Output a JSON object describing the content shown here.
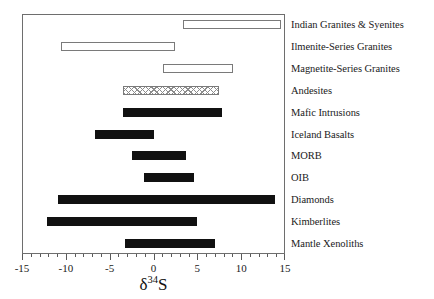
{
  "chart_data": {
    "type": "bar",
    "orientation": "horizontal-range",
    "title": "",
    "xlabel": "δ³⁴S",
    "ylabel": "",
    "xlim": [
      -15,
      15
    ],
    "xticks": [
      -15,
      -10,
      -5,
      0,
      5,
      10,
      15
    ],
    "xticklabels": [
      "-15",
      "-10",
      "-5",
      "0",
      "5",
      "10",
      "15"
    ],
    "minor_tick_interval": 1,
    "grid": false,
    "legend": "none",
    "categories": [
      "Indian Granites & Syenites",
      "Ilmenite-Series Granites",
      "Magnetite-Series Granites",
      "Andesites",
      "Mafic Intrusions",
      "Iceland Basalts",
      "MORB",
      "OIB",
      "Diamonds",
      "Kimberlites",
      "Mantle Xenoliths"
    ],
    "bars": [
      {
        "label": "Indian Granites & Syenites",
        "start": 3.4,
        "end": 14.6,
        "fill": "open"
      },
      {
        "label": "Ilmenite-Series Granites",
        "start": -10.6,
        "end": 2.4,
        "fill": "open"
      },
      {
        "label": "Magnetite-Series Granites",
        "start": 1.1,
        "end": 9.1,
        "fill": "open"
      },
      {
        "label": "Andesites",
        "start": -3.5,
        "end": 7.5,
        "fill": "hatch"
      },
      {
        "label": "Mafic Intrusions",
        "start": -3.5,
        "end": 7.8,
        "fill": "solid"
      },
      {
        "label": "Iceland Basalts",
        "start": -6.7,
        "end": 0.1,
        "fill": "solid"
      },
      {
        "label": "MORB",
        "start": -2.5,
        "end": 3.7,
        "fill": "solid"
      },
      {
        "label": "OIB",
        "start": -1.1,
        "end": 4.6,
        "fill": "solid"
      },
      {
        "label": "Diamonds",
        "start": -10.9,
        "end": 13.9,
        "fill": "solid"
      },
      {
        "label": "Kimberlites",
        "start": -12.2,
        "end": 5.0,
        "fill": "solid"
      },
      {
        "label": "Mantle Xenoliths",
        "start": -3.3,
        "end": 7.0,
        "fill": "solid"
      }
    ]
  },
  "axis": {
    "title_symbol": "δ",
    "title_sup": "34",
    "title_element": "S"
  },
  "colors": {
    "solid_fill": "#111111",
    "open_fill": "#ffffff",
    "open_stroke": "#7a7a7a",
    "hatch_stroke": "#8c8c8c",
    "frame": "#6e6e6e",
    "text": "#1a1a1a",
    "background": "#ffffff"
  }
}
